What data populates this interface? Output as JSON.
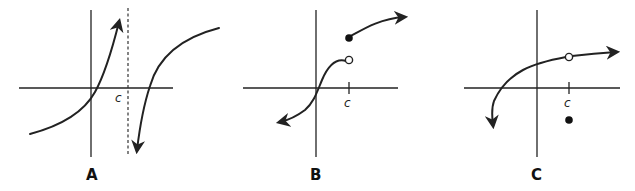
{
  "figure": {
    "panels": [
      {
        "label": "A",
        "point_label": "c",
        "features": [
          "vertical asymptote at x = c (dashed line)",
          "curve rising to +infinity left of c",
          "curve coming from -infinity right of c, increasing to the right"
        ]
      },
      {
        "label": "B",
        "point_label": "c",
        "features": [
          "jump discontinuity at x = c",
          "open circle at end of left branch",
          "filled dot at start of right branch (higher)",
          "arrows at both ends"
        ]
      },
      {
        "label": "C",
        "point_label": "c",
        "features": [
          "removable discontinuity at x = c",
          "open circle on the curve at x = c",
          "filled dot below x-axis at x = c",
          "arrows at both ends"
        ]
      }
    ]
  },
  "colors": {
    "ink": "#222222",
    "background": "#ffffff"
  }
}
